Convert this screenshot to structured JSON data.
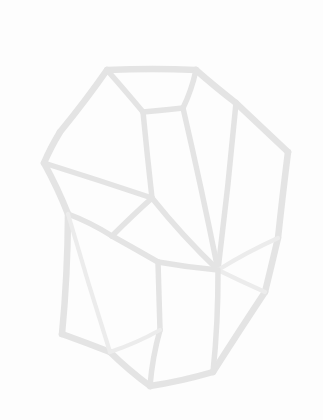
{
  "canvas": {
    "width": 323,
    "height": 420,
    "background_color": "#fdfdfd",
    "title": "Faceted crystal wireframe line drawing"
  },
  "figure": {
    "name": "gemstone-polyhedron-wireframe",
    "stroke_color": "#e4e4e4",
    "stroke_color_light": "#ececec",
    "stroke_width_outline": 6.5,
    "stroke_width_facet": 5.5,
    "stroke_width_thin": 4.2
  },
  "chart_data": {
    "type": "scatter",
    "xlabel": "",
    "ylabel": "",
    "xlim": [
      0,
      323
    ],
    "ylim": [
      0,
      420
    ],
    "grid": false,
    "legend": "none",
    "vertices": [
      {
        "id": "v_top_left",
        "x": 107,
        "y": 70,
        "label": "top-left crown vertex"
      },
      {
        "id": "v_top_right",
        "x": 196,
        "y": 70,
        "label": "top-right crown vertex"
      },
      {
        "id": "v_table_left",
        "x": 143,
        "y": 112,
        "label": "table inner left"
      },
      {
        "id": "v_table_right",
        "x": 183,
        "y": 108,
        "label": "table inner right"
      },
      {
        "id": "v_upper_left",
        "x": 60,
        "y": 132,
        "label": "upper-left shoulder"
      },
      {
        "id": "v_left",
        "x": 44,
        "y": 163,
        "label": "left girdle vertex"
      },
      {
        "id": "v_right",
        "x": 288,
        "y": 152,
        "label": "right girdle vertex"
      },
      {
        "id": "v_upper_right",
        "x": 236,
        "y": 103,
        "label": "upper-right shoulder"
      },
      {
        "id": "v_mid_left",
        "x": 68,
        "y": 214,
        "label": "mid-left junction"
      },
      {
        "id": "v_hub_left",
        "x": 112,
        "y": 236,
        "label": "left interior hub"
      },
      {
        "id": "v_mid_upper_inner",
        "x": 152,
        "y": 198,
        "label": "inner facet apex"
      },
      {
        "id": "v_hub_main",
        "x": 218,
        "y": 270,
        "label": "main interior hub"
      },
      {
        "id": "v_pav_left",
        "x": 62,
        "y": 334,
        "label": "lower-left pavilion vertex"
      },
      {
        "id": "v_pav_mid",
        "x": 110,
        "y": 352,
        "label": "lower-left keel"
      },
      {
        "id": "v_bottom",
        "x": 150,
        "y": 386,
        "label": "bottom culet vertex"
      },
      {
        "id": "v_bottom_right",
        "x": 213,
        "y": 372,
        "label": "bottom-right vertex"
      },
      {
        "id": "v_right_lower",
        "x": 265,
        "y": 292,
        "label": "right lower vertex"
      },
      {
        "id": "v_right_mid",
        "x": 278,
        "y": 238,
        "label": "right mid vertex"
      },
      {
        "id": "v_spine_mid",
        "x": 158,
        "y": 262,
        "label": "central spine node"
      },
      {
        "id": "v_spine_low",
        "x": 160,
        "y": 330,
        "label": "lower spine node"
      }
    ],
    "edges": [
      {
        "from": "v_top_left",
        "to": "v_top_right",
        "kind": "outline"
      },
      {
        "from": "v_top_right",
        "to": "v_upper_right",
        "kind": "outline"
      },
      {
        "from": "v_upper_right",
        "to": "v_right",
        "kind": "outline"
      },
      {
        "from": "v_right",
        "to": "v_right_mid",
        "kind": "outline"
      },
      {
        "from": "v_right_mid",
        "to": "v_right_lower",
        "kind": "outline"
      },
      {
        "from": "v_right_lower",
        "to": "v_bottom_right",
        "kind": "outline"
      },
      {
        "from": "v_bottom_right",
        "to": "v_bottom",
        "kind": "outline"
      },
      {
        "from": "v_bottom",
        "to": "v_pav_mid",
        "kind": "outline"
      },
      {
        "from": "v_pav_mid",
        "to": "v_pav_left",
        "kind": "outline"
      },
      {
        "from": "v_pav_left",
        "to": "v_mid_left",
        "kind": "outline"
      },
      {
        "from": "v_mid_left",
        "to": "v_left",
        "kind": "outline"
      },
      {
        "from": "v_left",
        "to": "v_upper_left",
        "kind": "outline"
      },
      {
        "from": "v_upper_left",
        "to": "v_top_left",
        "kind": "outline"
      },
      {
        "from": "v_top_left",
        "to": "v_table_left",
        "kind": "facet"
      },
      {
        "from": "v_table_left",
        "to": "v_table_right",
        "kind": "facet"
      },
      {
        "from": "v_table_right",
        "to": "v_top_right",
        "kind": "facet"
      },
      {
        "from": "v_table_left",
        "to": "v_mid_upper_inner",
        "kind": "facet"
      },
      {
        "from": "v_table_right",
        "to": "v_hub_main",
        "kind": "facet"
      },
      {
        "from": "v_left",
        "to": "v_mid_upper_inner",
        "kind": "facet"
      },
      {
        "from": "v_upper_right",
        "to": "v_hub_main",
        "kind": "facet"
      },
      {
        "from": "v_mid_left",
        "to": "v_hub_left",
        "kind": "facet"
      },
      {
        "from": "v_hub_left",
        "to": "v_mid_upper_inner",
        "kind": "facet"
      },
      {
        "from": "v_hub_left",
        "to": "v_spine_mid",
        "kind": "facet"
      },
      {
        "from": "v_mid_upper_inner",
        "to": "v_hub_main",
        "kind": "facet"
      },
      {
        "from": "v_spine_mid",
        "to": "v_hub_main",
        "kind": "facet"
      },
      {
        "from": "v_spine_mid",
        "to": "v_spine_low",
        "kind": "facet"
      },
      {
        "from": "v_spine_low",
        "to": "v_bottom",
        "kind": "facet"
      },
      {
        "from": "v_hub_main",
        "to": "v_right_mid",
        "kind": "thin"
      },
      {
        "from": "v_hub_main",
        "to": "v_right_lower",
        "kind": "thin"
      },
      {
        "from": "v_hub_main",
        "to": "v_bottom_right",
        "kind": "facet"
      },
      {
        "from": "v_spine_low",
        "to": "v_pav_mid",
        "kind": "thin"
      },
      {
        "from": "v_mid_left",
        "to": "v_pav_mid",
        "kind": "thin"
      }
    ],
    "counts": {
      "vertices": 20,
      "edges": 32
    }
  }
}
